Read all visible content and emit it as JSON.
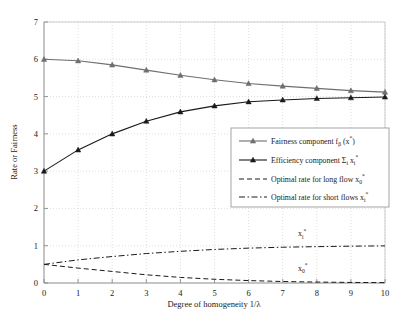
{
  "figure": {
    "background_color": "#ffffff",
    "axes_color": "#808080",
    "grid_color": "#c8c8c8"
  },
  "chart_data": {
    "type": "line",
    "title": "",
    "subtitle": "",
    "xlabel": "Degree of homogeneity 1/λ",
    "ylabel": "Rate or Fairness",
    "xlim": [
      0,
      10
    ],
    "ylim": [
      0,
      7
    ],
    "xticks": [
      "0",
      "1",
      "2",
      "3",
      "4",
      "5",
      "6",
      "7",
      "8",
      "9",
      "10"
    ],
    "yticks": [
      "0",
      "1",
      "2",
      "3",
      "4",
      "5",
      "6",
      "7"
    ],
    "grid": true,
    "grid_style": "dotted",
    "legend_position": "center-right",
    "x": [
      0,
      1,
      2,
      3,
      4,
      5,
      6,
      7,
      8,
      9,
      10
    ],
    "series": [
      {
        "name": "fairness-component",
        "legend_label": "Fairness component f",
        "legend_sub": "β",
        "legend_tail": " (x",
        "legend_sup": "*",
        "legend_close": ")",
        "color": "#6e6e6e",
        "marker": "triangle",
        "linestyle": "solid",
        "values": [
          6.0,
          5.96,
          5.85,
          5.71,
          5.57,
          5.45,
          5.35,
          5.28,
          5.22,
          5.16,
          5.12
        ]
      },
      {
        "name": "efficiency-component",
        "legend_label": "Efficiency component Σ",
        "legend_sub": "i",
        "legend_tail": " x",
        "legend_sub2": "i",
        "legend_sup": "*",
        "color": "#1a1a1a",
        "marker": "triangle",
        "linestyle": "solid",
        "values": [
          3.0,
          3.57,
          4.0,
          4.34,
          4.59,
          4.75,
          4.86,
          4.91,
          4.95,
          4.97,
          4.99
        ]
      },
      {
        "name": "optimal-rate-long-flow",
        "legend_label": "Optimal rate for long flow x",
        "legend_sub": "0",
        "legend_sup": "*",
        "color": "#1a1a1a",
        "marker": "none",
        "linestyle": "dashed",
        "values": [
          0.5,
          0.4,
          0.31,
          0.22,
          0.15,
          0.1,
          0.065,
          0.04,
          0.025,
          0.015,
          0.01
        ]
      },
      {
        "name": "optimal-rate-short-flows",
        "legend_label": "Optimal rate for short flows x",
        "legend_sub": "i",
        "legend_sup": "*",
        "color": "#1a1a1a",
        "marker": "none",
        "linestyle": "dashdot",
        "values": [
          0.5,
          0.62,
          0.71,
          0.79,
          0.85,
          0.9,
          0.935,
          0.96,
          0.975,
          0.988,
          0.995
        ]
      }
    ],
    "annotations": [
      {
        "name": "annotation-xi-star",
        "base": "x",
        "sub": "i",
        "sup": "*",
        "x": 7.45,
        "y": 1.25
      },
      {
        "name": "annotation-x0-star",
        "base": "x",
        "sub": "0",
        "sup": "*",
        "x": 7.45,
        "y": 0.33
      }
    ]
  }
}
